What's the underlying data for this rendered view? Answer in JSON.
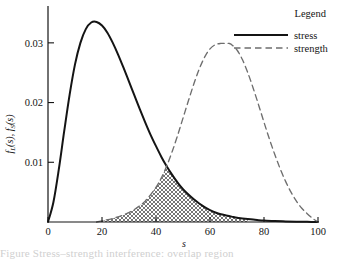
{
  "figure": {
    "background": "#ffffff",
    "ink_color": "#141414",
    "strength_color": "#6e6e6e",
    "caption_partial": "Figure  Stress–strength interference: overlap region"
  },
  "legend": {
    "title": "Legend",
    "entries": [
      {
        "label": "stress",
        "style": "solid",
        "color": "#141414"
      },
      {
        "label": "strength",
        "style": "dashed",
        "color": "#6e6e6e"
      }
    ]
  },
  "chart_data": {
    "type": "line",
    "title": "",
    "xlabel": "s",
    "ylabel": "f_L(s), f_S(s)",
    "ylabel_parts": [
      "f",
      "L",
      "(s), ",
      "f",
      "S",
      "(s)"
    ],
    "xlim": [
      0,
      100
    ],
    "ylim": [
      0,
      0.0355
    ],
    "xticks": [
      0,
      20,
      40,
      60,
      80,
      100
    ],
    "xticklabels": [
      "0",
      "20",
      "40",
      "60",
      "80",
      "100"
    ],
    "yticks": [
      0.01,
      0.02,
      0.03
    ],
    "yticklabels": [
      "0.01",
      "0.02",
      "0.03"
    ],
    "grid": false,
    "legend_position": "top-right",
    "annotations": [
      {
        "kind": "shaded-overlap",
        "pattern": "crosshatch",
        "x_start": 18,
        "x_end": 74,
        "crossing_x": 43,
        "crossing_y": 0.0078,
        "description": "overlap area between stress and strength densities"
      }
    ],
    "series": [
      {
        "name": "stress",
        "style": "solid",
        "color": "#141414",
        "peak_x": 18,
        "peak_y": 0.0335,
        "x": [
          0,
          2,
          4,
          6,
          8,
          10,
          12,
          14,
          16,
          18,
          20,
          22,
          24,
          26,
          28,
          30,
          32,
          34,
          36,
          38,
          40,
          42,
          44,
          46,
          48,
          50,
          52,
          54,
          56,
          58,
          60,
          62,
          64,
          66,
          68,
          70,
          72,
          74,
          76,
          78,
          80,
          84,
          88,
          92,
          96,
          100
        ],
        "y": [
          0.0,
          0.0033,
          0.0088,
          0.0152,
          0.0213,
          0.0264,
          0.03,
          0.0323,
          0.0334,
          0.0335,
          0.0329,
          0.0317,
          0.03,
          0.028,
          0.0258,
          0.0235,
          0.0212,
          0.0189,
          0.0167,
          0.0146,
          0.0127,
          0.0109,
          0.0093,
          0.0079,
          0.0066,
          0.0055,
          0.0046,
          0.0038,
          0.0031,
          0.0025,
          0.002,
          0.0016,
          0.0013,
          0.0011,
          0.0009,
          0.0007,
          0.0006,
          0.0005,
          0.0004,
          0.0003,
          0.00025,
          0.00015,
          0.0001,
          6e-05,
          3e-05,
          0.0
        ]
      },
      {
        "name": "strength",
        "style": "dashed",
        "color": "#6e6e6e",
        "peak_x": 67,
        "peak_y": 0.0299,
        "x": [
          18,
          20,
          24,
          28,
          32,
          36,
          40,
          42,
          44,
          46,
          48,
          50,
          52,
          54,
          56,
          58,
          60,
          62,
          64,
          66,
          67,
          68,
          70,
          72,
          74,
          76,
          78,
          80,
          82,
          84,
          86,
          88,
          90,
          92,
          94,
          96,
          98,
          100
        ],
        "y": [
          0.0,
          0.0002,
          0.0006,
          0.0012,
          0.0021,
          0.0035,
          0.0058,
          0.0074,
          0.0094,
          0.0118,
          0.0145,
          0.0174,
          0.0203,
          0.0231,
          0.0256,
          0.0276,
          0.029,
          0.0297,
          0.0299,
          0.0299,
          0.0299,
          0.0297,
          0.0288,
          0.0272,
          0.025,
          0.0224,
          0.0196,
          0.0167,
          0.0139,
          0.0113,
          0.0089,
          0.0068,
          0.005,
          0.0035,
          0.0023,
          0.0014,
          0.0006,
          0.0
        ]
      }
    ]
  }
}
